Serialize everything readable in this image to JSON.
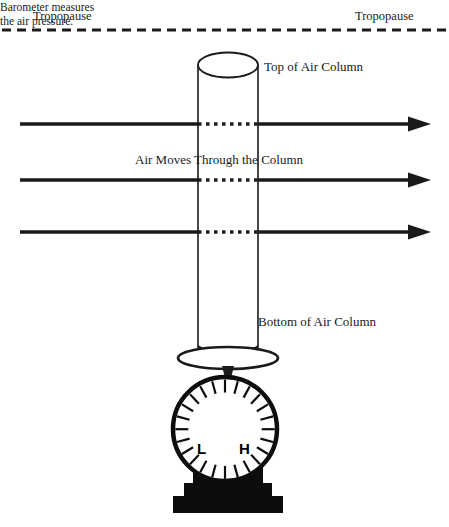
{
  "diagram": {
    "background_color": "#ffffff",
    "ink_color": "#1a1a1a",
    "labels": {
      "tropopause_left": "Tropopause",
      "tropopause_right": "Tropopause",
      "top_of_column": "Top of Air Column",
      "air_moves": "Air Moves Through the Column",
      "bottom_of_column": "Bottom of Air Column",
      "barometer_note_line1": "Barometer measures",
      "barometer_note_line2": "the air pressure."
    },
    "barometer": {
      "low_marker": "L",
      "high_marker": "H",
      "tick_count": 24
    },
    "arrows": {
      "count": 3,
      "direction": "left-to-right",
      "inside_column_style": "dotted"
    }
  }
}
